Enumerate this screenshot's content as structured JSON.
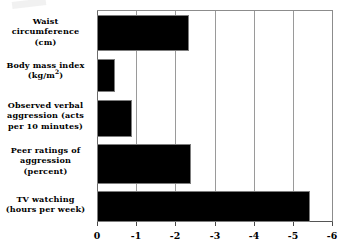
{
  "chart_data": {
    "type": "bar",
    "orientation": "horizontal",
    "title": "",
    "subtitle": "",
    "xlabel": "",
    "ylabel": "",
    "categories": [
      "Waist circumference (cm)",
      "Body mass index (kg/m²)",
      "Observed verbal aggression (acts per 10 minutes)",
      "Peer ratings of aggression (percent)",
      "TV watching (hours per week)"
    ],
    "values": [
      -2.35,
      -0.45,
      -0.9,
      -2.4,
      -5.45
    ],
    "xlim": [
      0,
      -6
    ],
    "xticks": [
      0,
      -1,
      -2,
      -3,
      -4,
      -5,
      -6
    ],
    "xtick_labels": [
      "0",
      "-1",
      "-2",
      "-3",
      "-4",
      "-5",
      "-6"
    ],
    "grid": true,
    "grid_axis": "x",
    "legend": false,
    "bar_color": "#000000",
    "grid_color": "#9a9a9a",
    "axis_color": "#555555",
    "background_color": "#ffffff"
  },
  "category_labels": [
    {
      "line1": "Waist",
      "line2": "circumference (cm)",
      "line3": ""
    },
    {
      "line1": "Body mass index",
      "line2_pre": "(kg/m",
      "line2_sup": "2",
      "line2_post": ")",
      "line3": ""
    },
    {
      "line1": "Observed verbal",
      "line2": "aggression (acts",
      "line3": "per 10 minutes)"
    },
    {
      "line1": "Peer ratings of",
      "line2": "aggression",
      "line3": "(percent)"
    },
    {
      "line1": "TV watching",
      "line2": "(hours per week)",
      "line3": ""
    }
  ],
  "axis": {
    "tick_0": "0",
    "tick_1": "-1",
    "tick_2": "-2",
    "tick_3": "-3",
    "tick_4": "-4",
    "tick_5": "-5",
    "tick_6": "-6"
  }
}
